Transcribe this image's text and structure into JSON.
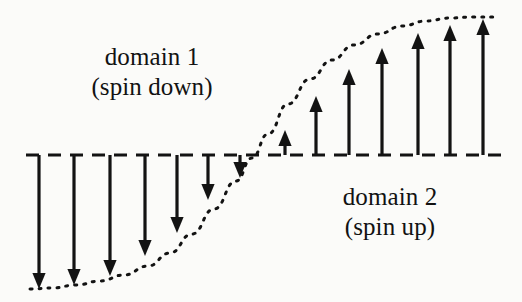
{
  "figure": {
    "kind": "magnetic-domain-wall-diagram",
    "background_color": "#fbfbf9",
    "ink_color": "#131313",
    "width": 522,
    "height": 302
  },
  "labels": {
    "domain_1": {
      "line1": "domain 1",
      "line2": "(spin down)"
    },
    "domain_2": {
      "line1": "domain 2",
      "line2": "(spin up)"
    }
  },
  "chart_data": {
    "type": "scatter",
    "title": "",
    "xlabel": "",
    "ylabel": "",
    "baseline_y": 155,
    "grid": false,
    "legend_position": "none",
    "annotations": [
      "domain 1",
      "(spin down)",
      "domain 2",
      "(spin up)"
    ],
    "baseline": {
      "name": "zero-magnetization-axis",
      "style": "dashed",
      "x_start": 26,
      "x_end": 503,
      "y": 155,
      "dash": "13 9",
      "stroke_width": 3.2
    },
    "curve": {
      "name": "magnetization-profile",
      "style": "dotted",
      "description": "sigmoid / tanh magnetization rotation across the wall",
      "dot_spacing": "2 7",
      "stroke_width": 3.0,
      "points": [
        [
          30,
          289
        ],
        [
          52,
          288
        ],
        [
          76,
          285
        ],
        [
          100,
          281
        ],
        [
          124,
          275
        ],
        [
          148,
          266
        ],
        [
          170,
          253
        ],
        [
          192,
          234
        ],
        [
          214,
          209
        ],
        [
          236,
          181
        ],
        [
          252,
          158
        ],
        [
          268,
          134
        ],
        [
          288,
          104
        ],
        [
          310,
          79
        ],
        [
          332,
          60
        ],
        [
          354,
          45
        ],
        [
          378,
          34
        ],
        [
          402,
          26
        ],
        [
          426,
          21
        ],
        [
          450,
          18
        ],
        [
          474,
          17
        ],
        [
          496,
          17
        ]
      ]
    },
    "arrows": {
      "spin_down": {
        "direction": "down",
        "count": 7,
        "tail_y": 155,
        "items": [
          {
            "index": 1,
            "x": 39,
            "tip_y": 289,
            "length": 134
          },
          {
            "index": 2,
            "x": 74,
            "tip_y": 285,
            "length": 130
          },
          {
            "index": 3,
            "x": 110,
            "tip_y": 276,
            "length": 121
          },
          {
            "index": 4,
            "x": 145,
            "tip_y": 256,
            "length": 101
          },
          {
            "index": 5,
            "x": 177,
            "tip_y": 233,
            "length": 78
          },
          {
            "index": 6,
            "x": 208,
            "tip_y": 200,
            "length": 45
          },
          {
            "index": 7,
            "x": 240,
            "tip_y": 178,
            "length": 23
          }
        ]
      },
      "spin_up": {
        "direction": "up",
        "count": 7,
        "tail_y": 155,
        "items": [
          {
            "index": 1,
            "x": 285,
            "tip_y": 130,
            "length": 25
          },
          {
            "index": 2,
            "x": 316,
            "tip_y": 96,
            "length": 59
          },
          {
            "index": 3,
            "x": 349,
            "tip_y": 69,
            "length": 86
          },
          {
            "index": 4,
            "x": 382,
            "tip_y": 48,
            "length": 107
          },
          {
            "index": 5,
            "x": 418,
            "tip_y": 33,
            "length": 122
          },
          {
            "index": 6,
            "x": 450,
            "tip_y": 25,
            "length": 130
          },
          {
            "index": 7,
            "x": 483,
            "tip_y": 19,
            "length": 136
          }
        ]
      }
    }
  }
}
